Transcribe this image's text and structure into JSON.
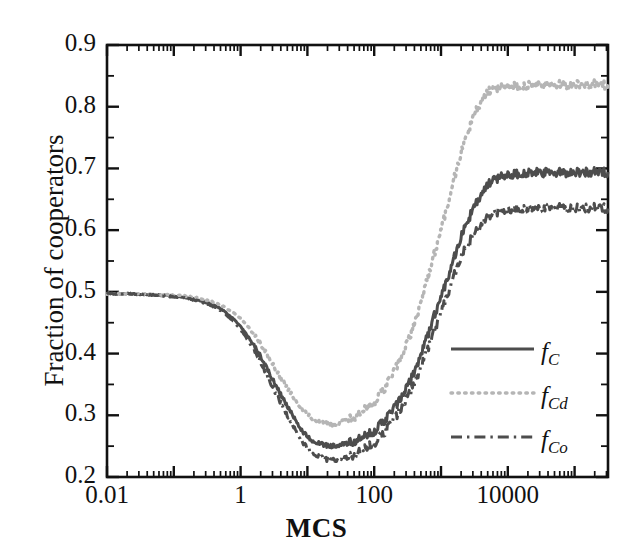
{
  "chart_data": {
    "type": "line",
    "title": "",
    "xlabel": "MCS",
    "ylabel": "Fraction of cooperators",
    "xscale": "log",
    "xlim": [
      0.01,
      316227.77
    ],
    "ylim": [
      0.2,
      0.9
    ],
    "grid": false,
    "legend_position": "lower right",
    "xticks_major": [
      {
        "value": 0.01,
        "label": "0.01"
      },
      {
        "value": 1,
        "label": "1"
      },
      {
        "value": 100,
        "label": "100"
      },
      {
        "value": 10000,
        "label": "10000"
      }
    ],
    "xticks_all_decades": [
      0.01,
      0.1,
      1,
      10,
      100,
      1000,
      10000,
      100000
    ],
    "yticks_major": [
      {
        "value": 0.2,
        "label": "0.2"
      },
      {
        "value": 0.3,
        "label": "0.3"
      },
      {
        "value": 0.4,
        "label": "0.4"
      },
      {
        "value": 0.5,
        "label": "0.5"
      },
      {
        "value": 0.6,
        "label": "0.6"
      },
      {
        "value": 0.7,
        "label": "0.7"
      },
      {
        "value": 0.8,
        "label": "0.8"
      },
      {
        "value": 0.9,
        "label": "0.9"
      }
    ],
    "yticks_minor": [
      0.25,
      0.35,
      0.45,
      0.55,
      0.65,
      0.75,
      0.85
    ],
    "series": [
      {
        "name": "f_C",
        "legend_text": "f",
        "legend_sub": "C",
        "style": "solid",
        "color": "#4d4d4d",
        "x": [
          0.01,
          0.02,
          0.03,
          0.05,
          0.08,
          0.12,
          0.2,
          0.3,
          0.5,
          0.8,
          1.2,
          2,
          3,
          5,
          8,
          12,
          20,
          30,
          50,
          80,
          120,
          200,
          300,
          500,
          800,
          1200,
          2000,
          3000,
          5000,
          8000,
          12000,
          20000,
          30000,
          50000,
          100000,
          200000,
          316228
        ],
        "y": [
          0.497,
          0.497,
          0.496,
          0.495,
          0.494,
          0.492,
          0.488,
          0.483,
          0.473,
          0.455,
          0.432,
          0.395,
          0.358,
          0.315,
          0.278,
          0.259,
          0.251,
          0.252,
          0.257,
          0.268,
          0.283,
          0.312,
          0.342,
          0.398,
          0.462,
          0.518,
          0.588,
          0.633,
          0.672,
          0.687,
          0.691,
          0.692,
          0.693,
          0.693,
          0.694,
          0.694,
          0.694
        ]
      },
      {
        "name": "f_Cd",
        "legend_text": "f",
        "legend_sub": "Cd",
        "style": "dotted",
        "color": "#b5b5b5",
        "x": [
          0.01,
          0.02,
          0.03,
          0.05,
          0.08,
          0.12,
          0.2,
          0.3,
          0.5,
          0.8,
          1.2,
          2,
          3,
          5,
          8,
          12,
          20,
          30,
          50,
          80,
          120,
          200,
          300,
          500,
          800,
          1200,
          2000,
          3000,
          5000,
          8000,
          12000,
          20000,
          30000,
          50000,
          100000,
          200000,
          316228
        ],
        "y": [
          0.497,
          0.497,
          0.497,
          0.496,
          0.495,
          0.494,
          0.491,
          0.487,
          0.479,
          0.465,
          0.447,
          0.415,
          0.383,
          0.344,
          0.312,
          0.295,
          0.286,
          0.288,
          0.296,
          0.312,
          0.332,
          0.372,
          0.412,
          0.483,
          0.562,
          0.635,
          0.725,
          0.782,
          0.822,
          0.832,
          0.834,
          0.834,
          0.835,
          0.835,
          0.836,
          0.836,
          0.836
        ]
      },
      {
        "name": "f_Co",
        "legend_text": "f",
        "legend_sub": "Co",
        "style": "dashdot",
        "color": "#4d4d4d",
        "x": [
          0.01,
          0.02,
          0.03,
          0.05,
          0.08,
          0.12,
          0.2,
          0.3,
          0.5,
          0.8,
          1.2,
          2,
          3,
          5,
          8,
          12,
          20,
          30,
          50,
          80,
          120,
          200,
          300,
          500,
          800,
          1200,
          2000,
          3000,
          5000,
          8000,
          12000,
          20000,
          30000,
          50000,
          100000,
          200000,
          316228
        ],
        "y": [
          0.497,
          0.497,
          0.496,
          0.495,
          0.493,
          0.491,
          0.487,
          0.481,
          0.47,
          0.451,
          0.426,
          0.386,
          0.346,
          0.3,
          0.261,
          0.239,
          0.228,
          0.229,
          0.235,
          0.248,
          0.264,
          0.294,
          0.324,
          0.378,
          0.438,
          0.492,
          0.556,
          0.59,
          0.62,
          0.632,
          0.634,
          0.635,
          0.635,
          0.636,
          0.636,
          0.636,
          0.636
        ]
      }
    ],
    "annotations": []
  },
  "legend": {
    "entries": [
      {
        "label": "f",
        "sub": "C"
      },
      {
        "label": "f",
        "sub": "Cd"
      },
      {
        "label": "f",
        "sub": "Co"
      }
    ]
  },
  "colors": {
    "axis": "#111111",
    "series_dark": "#4d4d4d",
    "series_light": "#b5b5b5",
    "background": "#ffffff"
  }
}
